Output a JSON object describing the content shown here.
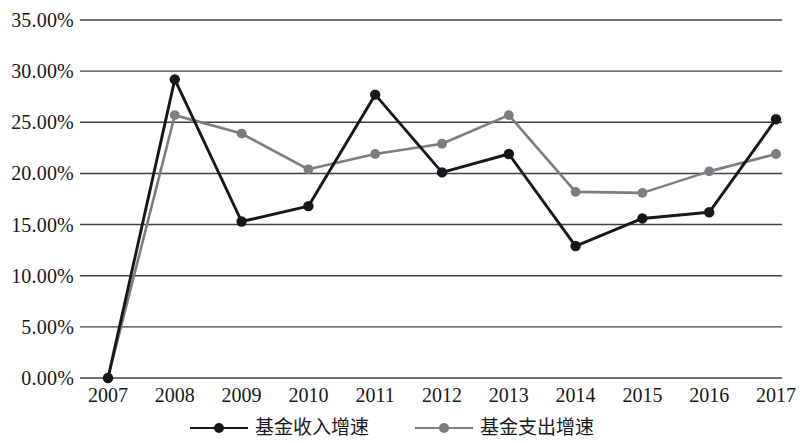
{
  "chart_data": {
    "type": "line",
    "title": "",
    "subtitle": "",
    "xlabel": "",
    "ylabel": "",
    "categories": [
      "2007",
      "2008",
      "2009",
      "2010",
      "2011",
      "2012",
      "2013",
      "2014",
      "2015",
      "2016",
      "2017"
    ],
    "series": [
      {
        "name": "基金收入增速",
        "color": "#16171b",
        "marker": "circle",
        "values": [
          0.0,
          29.2,
          15.3,
          16.8,
          27.7,
          20.1,
          21.9,
          12.9,
          15.6,
          16.2,
          25.3
        ]
      },
      {
        "name": "基金支出增速",
        "color": "#7c7d80",
        "marker": "circle",
        "values": [
          0.0,
          25.7,
          23.9,
          20.4,
          21.9,
          22.9,
          25.7,
          18.2,
          18.1,
          20.2,
          21.9
        ]
      }
    ],
    "ylim": [
      0,
      35
    ],
    "ytick_step": 5,
    "ytick_labels": [
      "0.00%",
      "5.00%",
      "10.00%",
      "15.00%",
      "20.00%",
      "25.00%",
      "30.00%",
      "35.00%"
    ],
    "ytick_values": [
      0,
      5,
      10,
      15,
      20,
      25,
      30,
      35
    ],
    "value_suffix": "%",
    "grid": {
      "horizontal": true,
      "vertical": false,
      "color": "#3f4044"
    },
    "legend": {
      "position": "bottom",
      "entries": [
        {
          "label": "基金收入增速",
          "color": "#16171b"
        },
        {
          "label": "基金支出增速",
          "color": "#7c7d80"
        }
      ]
    },
    "axis": {
      "x_axis_line": false,
      "y_axis_line": false,
      "background": "#ffffff"
    }
  }
}
